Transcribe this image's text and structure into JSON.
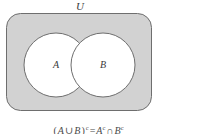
{
  "figure": {
    "type": "venn-diagram",
    "universe_label": "U",
    "sets": [
      {
        "name": "A",
        "label": "A"
      },
      {
        "name": "B",
        "label": "B"
      }
    ],
    "caption": {
      "full_text": "(A ∪ B)ᶜ = Aᶜ ∩ Bᶜ",
      "left_open_paren": "(",
      "left_set": "A",
      "union_symbol": "∪",
      "right_set": "B",
      "close_paren": ")",
      "complement_mark": "c",
      "equals_symbol": "=",
      "rhs_left_set": "A",
      "intersect_symbol": "∩",
      "rhs_right_set": "B",
      "note": "De Morgan's law"
    },
    "shading": {
      "shaded_region_description": "complement of A union B",
      "universe_fill_color": "#d2d2d2",
      "set_fill_color": "#ffffff",
      "outline_color": "#6e6e6e",
      "text_color": "#3a3a3a",
      "background_color": "#ffffff"
    },
    "geometry": {
      "rect_x": 6,
      "rect_y": 13,
      "rect_width": 146,
      "rect_height": 98,
      "rect_corner_radius": 14,
      "circle_a_cx": 56,
      "circle_a_cy": 65,
      "circle_b_cx": 103,
      "circle_b_cy": 65,
      "circle_radius": 32
    }
  }
}
